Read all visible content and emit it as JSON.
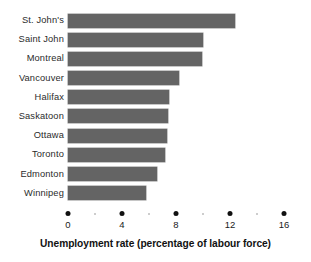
{
  "chart_data": {
    "type": "bar",
    "orientation": "horizontal",
    "title": "",
    "xlabel": "Unemployment rate (percentage of labour force)",
    "ylabel": "",
    "categories": [
      "St. John's",
      "Saint John",
      "Montreal",
      "Vancouver",
      "Halifax",
      "Saskatoon",
      "Ottawa",
      "Toronto",
      "Edmonton",
      "Winnipeg"
    ],
    "values": [
      12.4,
      10.0,
      9.9,
      8.2,
      7.5,
      7.4,
      7.3,
      7.2,
      6.6,
      5.8
    ],
    "xlim": [
      0,
      16
    ],
    "xticks": [
      0,
      4,
      8,
      12,
      16
    ],
    "xtick_labels": [
      "0",
      "4",
      "8",
      "12",
      "16"
    ],
    "xminor_ticks": [
      2,
      6,
      10,
      14
    ],
    "grid": false,
    "legend": null,
    "bar_color": "#646464",
    "axis_color": "#111111",
    "background_color": "#ffffff"
  }
}
